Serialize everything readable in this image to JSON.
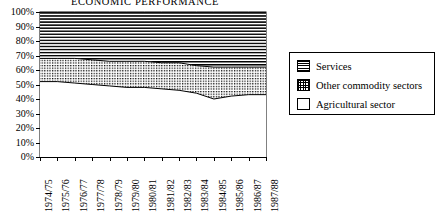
{
  "chart": {
    "title": "ECONOMIC PERFORMANCE"
  },
  "legend": {
    "items": [
      {
        "label": "Services",
        "pattern": "horizontal-lines",
        "color": "#000000"
      },
      {
        "label": "Other commodity sectors",
        "pattern": "dotted-grid",
        "color": "#000000"
      },
      {
        "label": "Agricultural sector",
        "pattern": "solid-white",
        "color": "#ffffff"
      }
    ]
  },
  "chart_data": {
    "type": "area",
    "title": "ECONOMIC PERFORMANCE",
    "subtitle": "",
    "xlabel": "",
    "ylabel": "",
    "stacked": true,
    "stack_total": 100,
    "grid": false,
    "legend_position": "right",
    "ylim": [
      0,
      100
    ],
    "yticks": [
      "0%",
      "10%",
      "20%",
      "30%",
      "40%",
      "50%",
      "60%",
      "70%",
      "80%",
      "90%",
      "100%"
    ],
    "ytick_values": [
      0,
      10,
      20,
      30,
      40,
      50,
      60,
      70,
      80,
      90,
      100
    ],
    "categories": [
      "1974/75",
      "1975/76",
      "1976/77",
      "1977/78",
      "1978/79",
      "1979/80",
      "1980/81",
      "1981/82",
      "1982/83",
      "1983/84",
      "1984/85",
      "1985/86",
      "1986/87",
      "1987/88"
    ],
    "series": [
      {
        "name": "Agricultural sector",
        "values": [
          52,
          52,
          51,
          50,
          49,
          48,
          48,
          47,
          46,
          44,
          40,
          42,
          43,
          43
        ]
      },
      {
        "name": "Other commodity sectors",
        "values": [
          16,
          16,
          17,
          17,
          17,
          18,
          18,
          18,
          19,
          19,
          22,
          20,
          19,
          19
        ]
      },
      {
        "name": "Services",
        "values": [
          32,
          32,
          32,
          33,
          34,
          34,
          34,
          35,
          35,
          37,
          38,
          38,
          38,
          38
        ]
      }
    ],
    "cumulative_boundaries": {
      "agricultural_top": [
        52,
        52,
        51,
        50,
        49,
        48,
        48,
        47,
        46,
        44,
        40,
        42,
        43,
        43
      ],
      "other_top": [
        68,
        68,
        68,
        67,
        66,
        66,
        66,
        65,
        65,
        63,
        62,
        62,
        62,
        62
      ]
    }
  },
  "axes": {
    "y_ticks": [
      "100%",
      "90%",
      "80%",
      "70%",
      "60%",
      "50%",
      "40%",
      "30%",
      "20%",
      "10%",
      "0%"
    ],
    "x_ticks": [
      "1974/75",
      "1975/76",
      "1976/77",
      "1977/78",
      "1978/79",
      "1979/80",
      "1980/81",
      "1981/82",
      "1982/83",
      "1983/84",
      "1984/85",
      "1985/86",
      "1986/87",
      "1987/88"
    ]
  }
}
